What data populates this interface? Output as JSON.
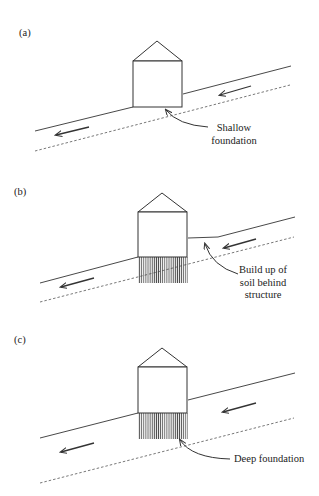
{
  "figure": {
    "colors": {
      "stroke": "#333333",
      "hatch": "#555555",
      "background": "#ffffff"
    },
    "panels": [
      {
        "id": "a",
        "label": "(a)",
        "foundation_type": "shallow",
        "callout_lines": [
          "Shallow",
          "foundation"
        ]
      },
      {
        "id": "b",
        "label": "(b)",
        "foundation_type": "piles-with-soil-buildup",
        "callout_lines": [
          "Build up of",
          "soil behind",
          "structure"
        ]
      },
      {
        "id": "c",
        "label": "(c)",
        "foundation_type": "deep",
        "callout_lines": [
          "Deep foundation"
        ]
      }
    ],
    "icons": {
      "movement_arrow": "left-down-arrow-icon",
      "callout_arrow": "curved-pointer-arrow-icon"
    }
  }
}
